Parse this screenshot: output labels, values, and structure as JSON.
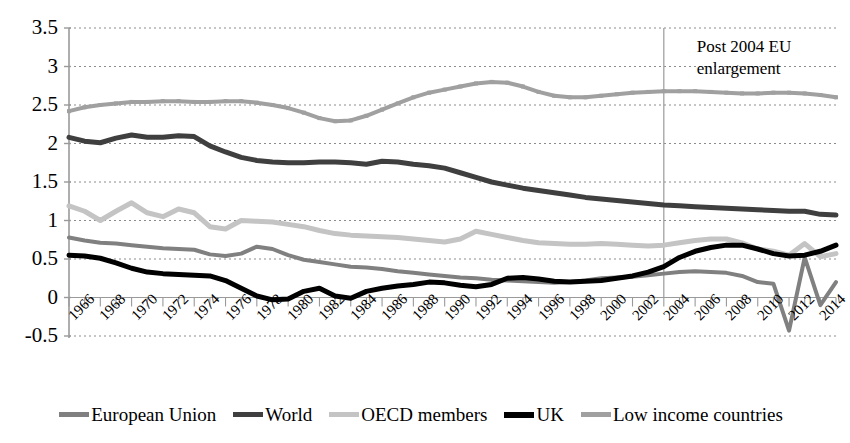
{
  "chart_data": {
    "type": "line",
    "title": "",
    "xlabel": "",
    "ylabel": "",
    "ylim": [
      -0.5,
      3.5
    ],
    "xlim": [
      1966,
      2015
    ],
    "grid": true,
    "legend_position": "bottom",
    "y_ticks": [
      "3.5",
      "3",
      "2.5",
      "2",
      "1.5",
      "1",
      "0.5",
      "0",
      "-0.5"
    ],
    "y_tick_values": [
      3.5,
      3,
      2.5,
      2,
      1.5,
      1,
      0.5,
      0,
      -0.5
    ],
    "x_tick_labels": [
      "1966",
      "1968",
      "1970",
      "1972",
      "1974",
      "1976",
      "1978",
      "1980",
      "1982",
      "1984",
      "1986",
      "1988",
      "1990",
      "1992",
      "1994",
      "1996",
      "1998",
      "2000",
      "2002",
      "2004",
      "2006",
      "2008",
      "2010",
      "2012",
      "2014"
    ],
    "x": [
      1966,
      1967,
      1968,
      1969,
      1970,
      1971,
      1972,
      1973,
      1974,
      1975,
      1976,
      1977,
      1978,
      1979,
      1980,
      1981,
      1982,
      1983,
      1984,
      1985,
      1986,
      1987,
      1988,
      1989,
      1990,
      1991,
      1992,
      1993,
      1994,
      1995,
      1996,
      1997,
      1998,
      1999,
      2000,
      2001,
      2002,
      2003,
      2004,
      2005,
      2006,
      2007,
      2008,
      2009,
      2010,
      2011,
      2012,
      2013,
      2014,
      2015
    ],
    "annotations": [
      {
        "text": "Post 2004 EU\nenlargement",
        "x": 2004,
        "type": "vline-label",
        "vline_x": 2004
      }
    ],
    "series": [
      {
        "name": "European Union",
        "color": "#808080",
        "width": 4,
        "marker": "none",
        "values": [
          0.78,
          0.74,
          0.71,
          0.7,
          0.68,
          0.66,
          0.64,
          0.63,
          0.62,
          0.56,
          0.54,
          0.57,
          0.66,
          0.63,
          0.55,
          0.49,
          0.46,
          0.43,
          0.4,
          0.39,
          0.37,
          0.34,
          0.32,
          0.3,
          0.28,
          0.26,
          0.25,
          0.23,
          0.22,
          0.21,
          0.2,
          0.19,
          0.2,
          0.22,
          0.25,
          0.26,
          0.27,
          0.29,
          0.31,
          0.33,
          0.34,
          0.33,
          0.32,
          0.28,
          0.2,
          0.18,
          -0.43,
          0.52,
          -0.1,
          0.2
        ]
      },
      {
        "name": "World",
        "color": "#3f3f3f",
        "width": 5,
        "marker": "none",
        "values": [
          2.08,
          2.03,
          2.01,
          2.07,
          2.11,
          2.08,
          2.08,
          2.1,
          2.09,
          1.97,
          1.89,
          1.82,
          1.78,
          1.76,
          1.75,
          1.75,
          1.76,
          1.76,
          1.75,
          1.73,
          1.77,
          1.76,
          1.73,
          1.71,
          1.68,
          1.62,
          1.56,
          1.5,
          1.46,
          1.42,
          1.39,
          1.36,
          1.33,
          1.3,
          1.28,
          1.26,
          1.24,
          1.22,
          1.2,
          1.19,
          1.18,
          1.17,
          1.16,
          1.15,
          1.14,
          1.13,
          1.12,
          1.12,
          1.08,
          1.07
        ]
      },
      {
        "name": "OECD members",
        "color": "#c4c4c4",
        "width": 5,
        "marker": "none",
        "values": [
          1.19,
          1.12,
          1.0,
          1.12,
          1.23,
          1.1,
          1.05,
          1.15,
          1.1,
          0.92,
          0.89,
          1.0,
          0.99,
          0.98,
          0.95,
          0.92,
          0.87,
          0.83,
          0.81,
          0.8,
          0.79,
          0.78,
          0.76,
          0.74,
          0.72,
          0.76,
          0.86,
          0.82,
          0.78,
          0.74,
          0.71,
          0.7,
          0.69,
          0.69,
          0.7,
          0.69,
          0.68,
          0.67,
          0.68,
          0.71,
          0.74,
          0.76,
          0.76,
          0.71,
          0.63,
          0.6,
          0.55,
          0.7,
          0.53,
          0.57
        ]
      },
      {
        "name": "UK",
        "color": "#000000",
        "width": 5,
        "marker": "none",
        "values": [
          0.55,
          0.54,
          0.51,
          0.45,
          0.38,
          0.33,
          0.31,
          0.3,
          0.29,
          0.28,
          0.22,
          0.12,
          0.02,
          -0.03,
          -0.02,
          0.08,
          0.12,
          0.02,
          -0.01,
          0.08,
          0.12,
          0.15,
          0.17,
          0.2,
          0.19,
          0.16,
          0.14,
          0.17,
          0.25,
          0.26,
          0.24,
          0.21,
          0.2,
          0.21,
          0.22,
          0.25,
          0.28,
          0.33,
          0.4,
          0.52,
          0.6,
          0.65,
          0.68,
          0.68,
          0.63,
          0.57,
          0.54,
          0.55,
          0.6,
          0.68
        ]
      },
      {
        "name": "Low income countries",
        "color": "#a0a0a0",
        "width": 4,
        "marker": "square",
        "values": [
          2.42,
          2.47,
          2.5,
          2.52,
          2.54,
          2.54,
          2.55,
          2.55,
          2.54,
          2.54,
          2.55,
          2.55,
          2.53,
          2.5,
          2.46,
          2.4,
          2.33,
          2.29,
          2.3,
          2.36,
          2.44,
          2.52,
          2.6,
          2.66,
          2.7,
          2.74,
          2.78,
          2.8,
          2.79,
          2.74,
          2.67,
          2.62,
          2.6,
          2.6,
          2.62,
          2.64,
          2.66,
          2.67,
          2.68,
          2.68,
          2.68,
          2.67,
          2.66,
          2.65,
          2.65,
          2.66,
          2.66,
          2.65,
          2.63,
          2.6
        ]
      }
    ]
  },
  "legend": {
    "items": [
      {
        "label": "European Union",
        "color": "#808080"
      },
      {
        "label": "World",
        "color": "#3f3f3f"
      },
      {
        "label": "OECD members",
        "color": "#c4c4c4"
      },
      {
        "label": "UK",
        "color": "#000000"
      },
      {
        "label": "Low income countries",
        "color": "#a0a0a0"
      }
    ]
  },
  "annotation": {
    "line1": "Post 2004 EU",
    "line2": "enlargement"
  }
}
